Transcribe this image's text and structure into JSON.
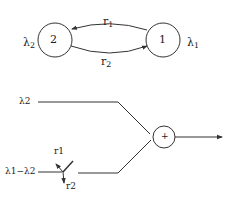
{
  "top_diagram": {
    "node_left": {
      "label": "2",
      "rate_symbol": "λ",
      "rate_sub": "2"
    },
    "node_right": {
      "label": "1",
      "rate_symbol": "λ",
      "rate_sub": "1"
    },
    "edge_top": {
      "symbol": "r",
      "sub": "1",
      "direction": "1 to 2"
    },
    "edge_bottom": {
      "symbol": "r",
      "sub": "2",
      "direction": "2 to 1"
    }
  },
  "bottom_diagram": {
    "input_top": "λ2",
    "input_bottom": "λ1−λ2",
    "switch_up_label": "r1",
    "switch_down_label": "r2",
    "summer_symbol": "+"
  },
  "colors": {
    "stroke": "#333333",
    "text": "#222222",
    "background": "#ffffff"
  }
}
